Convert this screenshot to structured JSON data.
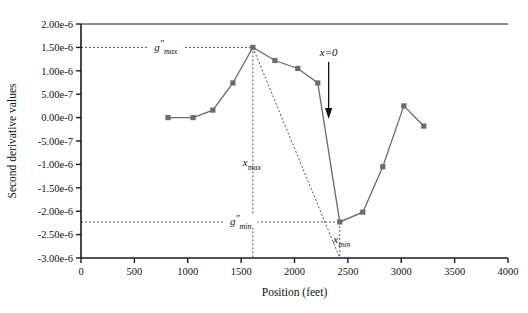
{
  "chart_data": {
    "type": "line",
    "title": "",
    "xlabel": "Position (feet)",
    "ylabel": "Second derivative values",
    "xlim": [
      0,
      4000
    ],
    "ylim": [
      -3e-06,
      2e-06
    ],
    "grid": false,
    "legend": "none",
    "xticks": [
      0,
      500,
      1000,
      1500,
      2000,
      2500,
      3000,
      3500,
      4000
    ],
    "xticklabels": [
      "0",
      "500",
      "1000",
      "1500",
      "2000",
      "2500",
      "3000",
      "3500",
      "4000"
    ],
    "yticks": [
      2e-06,
      1.5e-06,
      1e-06,
      5e-07,
      0.0,
      -5e-07,
      -1e-06,
      -1.5e-06,
      -2e-06,
      -2.5e-06,
      -3e-06
    ],
    "yticklabels": [
      "2.00e-6",
      "1.50e-6",
      "1.00e-6",
      "5.00e-7",
      "0.00e-0",
      "-5.00e-7",
      "-1.00e-6",
      "-1.50e-6",
      "-2.00e-6",
      "-2.50e-6",
      "-3.00e-6"
    ],
    "series": [
      {
        "name": "second derivative",
        "marker": "square",
        "color": "#6b6b6b",
        "x": [
          815,
          1050,
          1235,
          1423,
          1610,
          1816,
          2031,
          2218,
          2424,
          2640,
          2827,
          3024,
          3211
        ],
        "y": [
          0.0,
          0.0,
          1.6e-07,
          7.4e-07,
          1.5e-06,
          1.22e-06,
          1.05e-06,
          7.4e-07,
          -2.23e-06,
          -2.02e-06,
          -1.05e-06,
          2.5e-07,
          -1.8e-07
        ]
      }
    ],
    "guides": {
      "gmax_value": 1.5e-06,
      "gmin_value": -2.23e-06,
      "xmax_value": 1610,
      "xmin_value": 2424,
      "tangent_from": [
        1610,
        1.5e-06
      ],
      "tangent_to": [
        2424,
        -3e-06
      ]
    },
    "annotations": [
      {
        "name": "gmax-label",
        "base": "g",
        "prime": "″",
        "sub": "max",
        "x": 1610,
        "y": 1.5e-06
      },
      {
        "name": "gmin-label",
        "base": "g",
        "prime": "″",
        "sub": "min",
        "x": 2424,
        "y": -2.23e-06
      },
      {
        "name": "xmax-label",
        "base": "x",
        "sub": "max",
        "x": 1610
      },
      {
        "name": "xmin-label",
        "base": "x",
        "sub": "min",
        "x": 2424
      },
      {
        "name": "x-zero-label",
        "text": "x=0",
        "x": 2320,
        "arrow": "down"
      }
    ]
  },
  "labels": {
    "gmax": "g",
    "gmax_prime": "″",
    "gmax_sub": "max",
    "gmin": "g",
    "gmin_prime": "″",
    "gmin_sub": "min",
    "xmax": "x",
    "xmax_sub": "max",
    "xmin": "x",
    "xmin_sub": "min",
    "xzero": "x=0"
  },
  "colors": {
    "axis": "#1a1a1a",
    "line": "#6b6b6b",
    "marker": "#6b6b6b",
    "guide": "#555555",
    "background": "#ffffff"
  }
}
